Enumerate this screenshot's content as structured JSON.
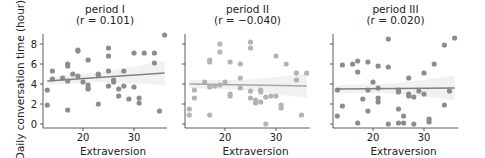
{
  "chart_data": {
    "type": "scatter",
    "shared_ylabel": "Daily conversation time (hour)",
    "xlabel": "Extraversion",
    "xlim": [
      12,
      37
    ],
    "ylim": [
      -0.4,
      9.2
    ],
    "xticks": [
      20,
      30
    ],
    "yticks": [
      0,
      2,
      4,
      6,
      8
    ],
    "colors": {
      "points": "#8c8c8c",
      "points_period2": "#b3b3b3",
      "line": "#7f7f7f",
      "line_period2": "#a6a6a6",
      "band": "#eeeeee",
      "axis": "#333333"
    },
    "panels": [
      {
        "title": "period I",
        "subtitle": "(r = 0.101)",
        "r": 0.101,
        "fit": {
          "x0": 13,
          "y0": 4.3,
          "x1": 36,
          "y1": 5.1
        },
        "points": [
          [
            36,
            8.9
          ],
          [
            19,
            7.4
          ],
          [
            19,
            7.3
          ],
          [
            25,
            7.6
          ],
          [
            25,
            6.8
          ],
          [
            30,
            7.1
          ],
          [
            32,
            7.1
          ],
          [
            34,
            7.1
          ],
          [
            34,
            6.1
          ],
          [
            21,
            6.4
          ],
          [
            17,
            6.0
          ],
          [
            17,
            5.8
          ],
          [
            14,
            5.3
          ],
          [
            25,
            5.3
          ],
          [
            28,
            5.3
          ],
          [
            18,
            5.0
          ],
          [
            23,
            5.0
          ],
          [
            23,
            4.9
          ],
          [
            19,
            4.8
          ],
          [
            14,
            4.5
          ],
          [
            16,
            4.6
          ],
          [
            17,
            4.3
          ],
          [
            26,
            4.4
          ],
          [
            26,
            4.2
          ],
          [
            20,
            4.2
          ],
          [
            21,
            3.9
          ],
          [
            21,
            3.5
          ],
          [
            21,
            3.6
          ],
          [
            25,
            3.8
          ],
          [
            28,
            3.8
          ],
          [
            30,
            3.7
          ],
          [
            27,
            3.5
          ],
          [
            13,
            3.4
          ],
          [
            27,
            2.8
          ],
          [
            29,
            2.5
          ],
          [
            31,
            2.6
          ],
          [
            31,
            2.1
          ],
          [
            23,
            2.0
          ],
          [
            13,
            1.9
          ],
          [
            17,
            1.4
          ],
          [
            35,
            1.3
          ]
        ]
      },
      {
        "title": "period II",
        "subtitle": "(r = −0.040)",
        "r": -0.04,
        "fit": {
          "x0": 13,
          "y0": 4.0,
          "x1": 36,
          "y1": 3.8
        },
        "points": [
          [
            25,
            8.2
          ],
          [
            19,
            8.0
          ],
          [
            25,
            7.6
          ],
          [
            19,
            7.2
          ],
          [
            30,
            6.8
          ],
          [
            17,
            6.4
          ],
          [
            17,
            6.2
          ],
          [
            21,
            6.2
          ],
          [
            32,
            6.0
          ],
          [
            23,
            6.0
          ],
          [
            34,
            5.1
          ],
          [
            36,
            5.1
          ],
          [
            23,
            4.6
          ],
          [
            34,
            4.4
          ],
          [
            16,
            4.2
          ],
          [
            20,
            4.2
          ],
          [
            19,
            3.9
          ],
          [
            18,
            3.8
          ],
          [
            17,
            3.7
          ],
          [
            23,
            3.6
          ],
          [
            14,
            3.4
          ],
          [
            25,
            3.3
          ],
          [
            27,
            3.4
          ],
          [
            27,
            3.2
          ],
          [
            21,
            3.0
          ],
          [
            21,
            2.8
          ],
          [
            14,
            2.6
          ],
          [
            25,
            2.6
          ],
          [
            26,
            2.4
          ],
          [
            26,
            2.1
          ],
          [
            28,
            2.7
          ],
          [
            29,
            2.8
          ],
          [
            30,
            2.8
          ],
          [
            27,
            2.2
          ],
          [
            31,
            1.9
          ],
          [
            31,
            1.6
          ],
          [
            13,
            1.5
          ],
          [
            17,
            0.9
          ],
          [
            13,
            0.9
          ],
          [
            35,
            0.9
          ],
          [
            28,
            0.0
          ]
        ]
      },
      {
        "title": "period III",
        "subtitle": "(r = 0.020)",
        "r": 0.02,
        "fit": {
          "x0": 13,
          "y0": 3.5,
          "x1": 36,
          "y1": 3.6
        },
        "points": [
          [
            23,
            8.5
          ],
          [
            36,
            8.6
          ],
          [
            34,
            7.9
          ],
          [
            17,
            6.3
          ],
          [
            16,
            6.0
          ],
          [
            19,
            6.2
          ],
          [
            14,
            5.9
          ],
          [
            21,
            5.8
          ],
          [
            23,
            5.7
          ],
          [
            32,
            6.0
          ],
          [
            17,
            5.2
          ],
          [
            30,
            5.1
          ],
          [
            27,
            4.6
          ],
          [
            20,
            4.2
          ],
          [
            21,
            3.6
          ],
          [
            13,
            3.4
          ],
          [
            19,
            3.4
          ],
          [
            25,
            3.4
          ],
          [
            25,
            3.2
          ],
          [
            27,
            3.0
          ],
          [
            27,
            2.8
          ],
          [
            28,
            2.7
          ],
          [
            29,
            3.3
          ],
          [
            30,
            3.0
          ],
          [
            35,
            3.3
          ],
          [
            21,
            2.6
          ],
          [
            18,
            2.5
          ],
          [
            21,
            2.2
          ],
          [
            14,
            1.8
          ],
          [
            34,
            1.9
          ],
          [
            25,
            1.5
          ],
          [
            19,
            1.3
          ],
          [
            26,
            0.8
          ],
          [
            13,
            0.8
          ],
          [
            31,
            0.5
          ],
          [
            31,
            0.2
          ],
          [
            17,
            0.1
          ],
          [
            23,
            0.0
          ],
          [
            25,
            0.1
          ],
          [
            26,
            0.1
          ],
          [
            28,
            0.0
          ]
        ]
      }
    ]
  }
}
